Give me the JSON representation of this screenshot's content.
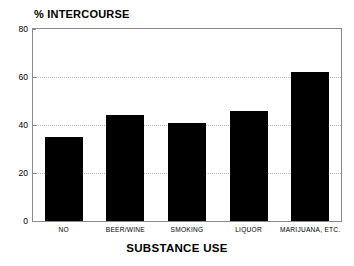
{
  "chart_data": {
    "type": "bar",
    "title": "% INTERCOURSE",
    "xlabel": "SUBSTANCE USE",
    "ylabel": "",
    "categories": [
      "NO",
      "BEER/WINE",
      "SMOKING",
      "LIQUOR",
      "MARIJUANA, ETC."
    ],
    "values": [
      35,
      44,
      41,
      46,
      62
    ],
    "ylim": [
      0,
      80
    ],
    "yticks": [
      0,
      20,
      40,
      60,
      80
    ],
    "ytick_labels": [
      "0",
      "20",
      "40",
      "60",
      "80"
    ],
    "grid": true,
    "grid_axis": "y",
    "grid_style": "dotted",
    "legend": false,
    "bar_color": "#000000",
    "frame_color": "#8a8a8a",
    "grid_color": "#b9b9b9",
    "background": "#ffffff"
  }
}
